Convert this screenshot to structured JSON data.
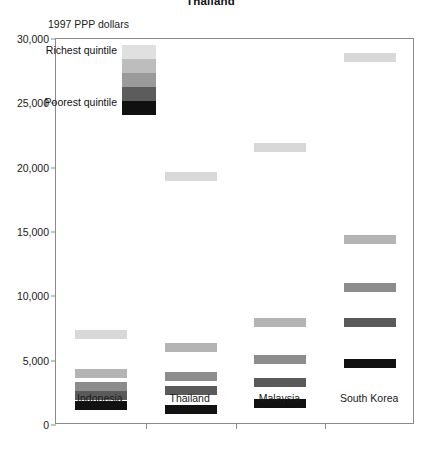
{
  "chart_data": {
    "type": "bar",
    "title": "Thailand",
    "subtitle": "",
    "ylabel": "1997 PPP dollars",
    "xlabel": "",
    "ylim": [
      0,
      30000
    ],
    "ytick_labels": [
      "0",
      "5,000",
      "10,000",
      "15,000",
      "20,000",
      "25,000",
      "30,000"
    ],
    "ytick_values": [
      0,
      5000,
      10000,
      15000,
      20000,
      25000,
      30000
    ],
    "grid": false,
    "legend_position": "inside-top-left",
    "categories": [
      "Indonesia",
      "Thailand",
      "Malaysia",
      "South Korea"
    ],
    "series": [
      {
        "name": "Richest quintile",
        "shade": "#d8d8d8",
        "values": [
          7000,
          19300,
          21600,
          28600
        ]
      },
      {
        "name": "Fourth quintile",
        "shade": "#b4b4b4",
        "values": [
          4000,
          6000,
          8000,
          14400
        ]
      },
      {
        "name": "Third quintile",
        "shade": "#8c8c8c",
        "values": [
          3000,
          3800,
          5100,
          10700
        ]
      },
      {
        "name": "Second quintile",
        "shade": "#5a5a5a",
        "values": [
          2300,
          2700,
          3300,
          8000
        ]
      },
      {
        "name": "Poorest quintile",
        "shade": "#111111",
        "values": [
          1500,
          1200,
          1700,
          4800
        ]
      }
    ]
  },
  "legend": {
    "top_label": "Richest quintile",
    "bottom_label": "Poorest quintile",
    "bands": [
      "#e0e0e0",
      "#bdbdbd",
      "#9a9a9a",
      "#5c5c5c",
      "#101010"
    ]
  },
  "colors": {
    "axis": "#8a8a8a",
    "text": "#1a1a1a",
    "background": "#ffffff"
  }
}
